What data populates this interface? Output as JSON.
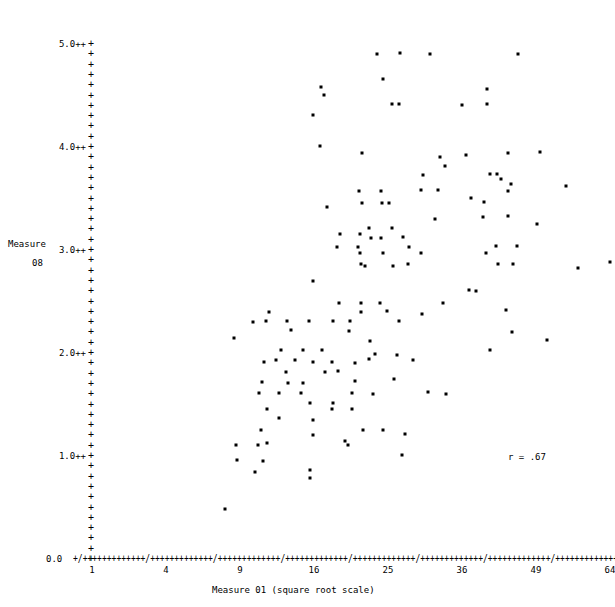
{
  "plot": {
    "background_color": "#ffffff",
    "point_color": "#000000",
    "axis_char_major": "/",
    "axis_char_minor": "+",
    "y_axis_title_line1": "Measure",
    "y_axis_title_line2": "08",
    "x_axis_title": "Measure 01 (square root scale)",
    "x_zero_label": "0.0",
    "annotation": "r = .67"
  },
  "y_axis": {
    "labels": [
      "5.0++",
      "4.0++",
      "3.0++",
      "2.0++",
      "1.0++"
    ],
    "tick_values": [
      5.0,
      4.0,
      3.0,
      2.0,
      1.0
    ],
    "min": 0.0,
    "max": 5.0,
    "tick_glyph": "+",
    "minor_ticks_per_unit": 10
  },
  "x_axis": {
    "tick_labels": [
      "1",
      "4",
      "9",
      "16",
      "25",
      "36",
      "49",
      "64"
    ],
    "tick_values": [
      1,
      4,
      9,
      16,
      25,
      36,
      49,
      64
    ],
    "scale": "square root",
    "min": 1,
    "max": 64
  },
  "chart_data": {
    "type": "scatter",
    "title": "",
    "subtitle": "",
    "xlabel": "Measure 01 (square root scale)",
    "ylabel": "Measure 08",
    "xlim": [
      1,
      64
    ],
    "ylim": [
      0.0,
      5.0
    ],
    "xscale": "sqrt",
    "xticks": [
      1,
      4,
      9,
      16,
      25,
      36,
      49,
      64
    ],
    "yticks": [
      0.0,
      1.0,
      2.0,
      3.0,
      4.0,
      5.0
    ],
    "grid": false,
    "legend": null,
    "annotations": [
      {
        "text": "r = .67",
        "x_px": 508,
        "y_px": 453
      }
    ],
    "marker": "star",
    "n_points": 139,
    "correlation_r": 0.67,
    "points_px": [
      [
        377,
        54
      ],
      [
        400,
        53
      ],
      [
        430,
        54
      ],
      [
        518,
        54
      ],
      [
        383,
        79
      ],
      [
        321,
        87
      ],
      [
        324,
        95
      ],
      [
        392,
        104
      ],
      [
        399,
        104
      ],
      [
        462,
        105
      ],
      [
        487,
        104
      ],
      [
        487,
        89
      ],
      [
        313,
        115
      ],
      [
        363,
        153
      ],
      [
        440,
        157
      ],
      [
        508,
        153
      ],
      [
        445,
        165
      ],
      [
        360,
        128
      ],
      [
        423,
        174
      ],
      [
        490,
        174
      ],
      [
        497,
        174
      ],
      [
        440,
        172
      ],
      [
        501,
        178
      ],
      [
        511,
        183
      ],
      [
        359,
        191
      ],
      [
        381,
        191
      ],
      [
        438,
        190
      ],
      [
        508,
        191
      ],
      [
        565,
        186
      ],
      [
        362,
        203
      ],
      [
        382,
        203
      ],
      [
        388,
        203
      ],
      [
        327,
        206
      ],
      [
        370,
        228
      ],
      [
        393,
        228
      ],
      [
        540,
        207
      ],
      [
        371,
        237
      ],
      [
        381,
        237
      ],
      [
        403,
        237
      ],
      [
        484,
        201
      ],
      [
        566,
        201
      ],
      [
        337,
        234
      ],
      [
        359,
        234
      ],
      [
        365,
        265
      ],
      [
        483,
        216
      ],
      [
        340,
        249
      ],
      [
        363,
        249
      ],
      [
        409,
        247
      ],
      [
        496,
        246
      ],
      [
        517,
        246
      ]
    ]
  }
}
